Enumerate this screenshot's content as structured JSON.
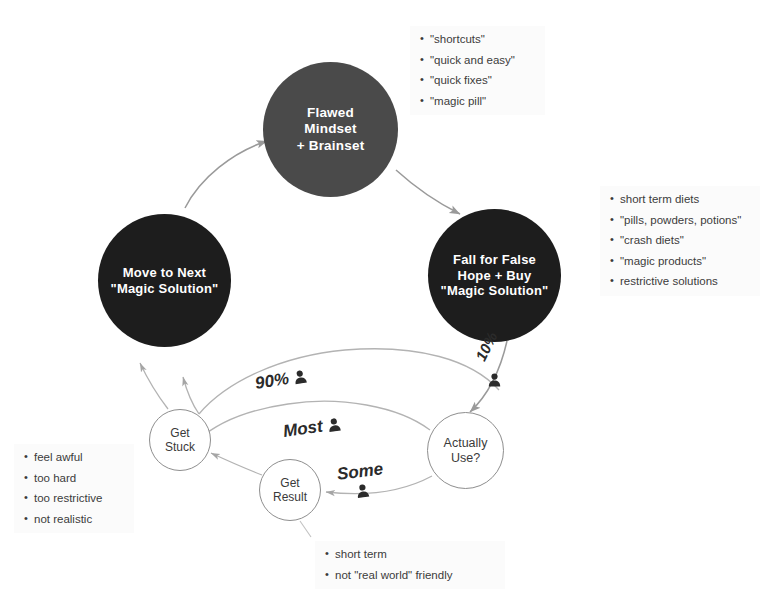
{
  "diagram": {
    "colors": {
      "node_dark": "#1d1d1d",
      "node_grey": "#4a4a4a",
      "node_text": "#ffffff",
      "arc_line": "#9a9a9a",
      "small_node_border": "#8e8e8e",
      "note_bg": "#fbfbfb",
      "body_text": "#3b3b3b",
      "background": "#ffffff"
    },
    "nodes": {
      "mindset": {
        "id": "flawed-mindset",
        "label": "Flawed\nMindset\n+ Brainset",
        "shape": "circle",
        "fill": "grey"
      },
      "fall": {
        "id": "fall-for-false-hope",
        "label": "Fall for False\nHope + Buy\n\"Magic Solution\"",
        "shape": "circle",
        "fill": "dark"
      },
      "move": {
        "id": "move-to-next",
        "label": "Move to Next\n\"Magic Solution\"",
        "shape": "circle",
        "fill": "dark"
      },
      "get_stuck": {
        "id": "get-stuck",
        "label": "Get\nStuck",
        "shape": "circle-outline"
      },
      "get_result": {
        "id": "get-result",
        "label": "Get\nResult",
        "shape": "circle-outline"
      },
      "actually_use": {
        "id": "actually-use",
        "label": "Actually\nUse?",
        "shape": "circle-outline"
      }
    },
    "flow_labels": {
      "ninety": {
        "text": "90%",
        "icon": "person-icon"
      },
      "most": {
        "text": "Most",
        "icon": "person-icon"
      },
      "some": {
        "text": "Some",
        "icon": "person-icon"
      },
      "ten": {
        "text": "10%",
        "icon": "person-icon"
      }
    },
    "notes": {
      "mindset": {
        "name": "mindset-keywords",
        "items": [
          "\"shortcuts\"",
          "\"quick and easy\"",
          "\"quick fixes\"",
          "\"magic pill\""
        ]
      },
      "products": {
        "name": "magic-solution-products",
        "items": [
          "short term diets",
          "\"pills, powders, potions\"",
          "\"crash diets\"",
          "\"magic products\"",
          "restrictive solutions"
        ]
      },
      "stuck": {
        "name": "get-stuck-reasons",
        "items": [
          "feel awful",
          "too hard",
          "too restrictive",
          "not realistic"
        ]
      },
      "result": {
        "name": "get-result-caveats",
        "items": [
          "short term",
          "not \"real world\" friendly"
        ]
      }
    }
  }
}
